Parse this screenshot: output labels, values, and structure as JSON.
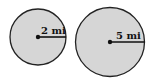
{
  "diagram": {
    "circles": [
      {
        "id": "small",
        "radius_label": "2 mi",
        "radius_value": 2,
        "unit": "mi"
      },
      {
        "id": "large",
        "radius_label": "5 mi",
        "radius_value": 5,
        "unit": "mi"
      }
    ],
    "colors": {
      "fill": "#d6d6d6",
      "stroke": "#222222",
      "text": "#111111"
    }
  }
}
